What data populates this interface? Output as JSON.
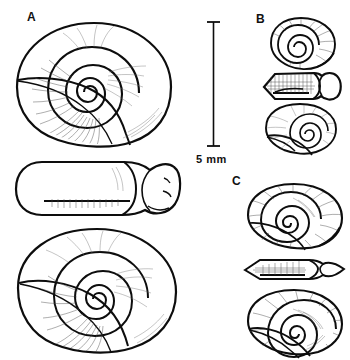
{
  "figure": {
    "kind": "scientific-line-drawing-plate",
    "background_color": "#ffffff",
    "ink_color": "#0d0d0d",
    "hatch_color": "#4a4a4a"
  },
  "panels": [
    {
      "id": "A",
      "label": "A",
      "label_x": 27,
      "label_y": 11,
      "views": [
        {
          "name": "apical-view",
          "order": 1,
          "shape": "large discoidal shell, whorls coiling clockwise to a central apex"
        },
        {
          "name": "apertural-edge-view",
          "order": 2,
          "shape": "elongate flattened profile with rounded aperture at right"
        },
        {
          "name": "umbilical-view",
          "order": 3,
          "shape": "large discoidal shell, deep umbilicus, whorls to centre"
        }
      ]
    },
    {
      "id": "B",
      "label": "B",
      "label_x": 256,
      "label_y": 13,
      "views": [
        {
          "name": "apical-view",
          "order": 1,
          "shape": "small rounded shell with tight spire"
        },
        {
          "name": "apertural-edge-view",
          "order": 2,
          "shape": "squat hexagonal profile with rounded aperture at right"
        },
        {
          "name": "umbilical-view",
          "order": 3,
          "shape": "small rounded shell, open umbilicus"
        }
      ]
    },
    {
      "id": "C",
      "label": "C",
      "label_x": 232,
      "label_y": 175,
      "views": [
        {
          "name": "apical-view",
          "order": 1,
          "shape": "medium discoidal shell with broad body whorl"
        },
        {
          "name": "apertural-edge-view",
          "order": 2,
          "shape": "narrow lens-shaped (lenticular) edge profile, sharply keeled"
        },
        {
          "name": "umbilical-view",
          "order": 3,
          "shape": "medium discoidal shell, wide umbilicus, radial growth lines"
        }
      ]
    }
  ],
  "scale_bar": {
    "label": "5 mm",
    "orientation": "vertical",
    "x": 213,
    "y_top": 22,
    "y_bottom": 146,
    "has_end_caps": true,
    "label_x": 196,
    "label_y": 153
  }
}
